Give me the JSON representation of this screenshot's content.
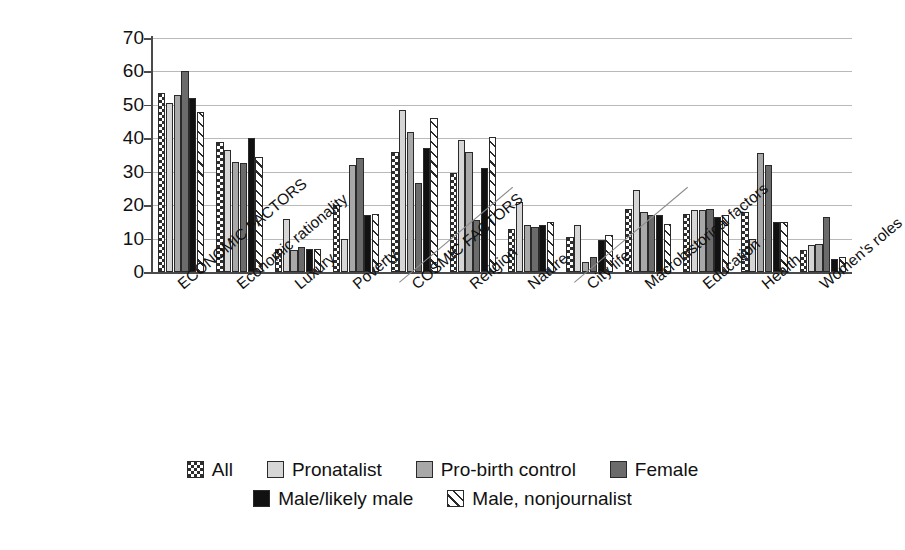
{
  "chart_data": {
    "type": "bar",
    "title": "",
    "xlabel": "",
    "ylabel": "",
    "ylim": [
      0,
      70
    ],
    "yticks": [
      0,
      10,
      20,
      30,
      40,
      50,
      60,
      70
    ],
    "grid": true,
    "legend_position": "bottom",
    "categories": [
      "ECONOMIC FACTORS",
      "Economic rationality",
      "Luxury",
      "Poverty",
      "COSMIC FACTORS",
      "Religion",
      "Nature",
      "City life",
      "Macrohistorical factors",
      "Education",
      "Health",
      "Women's roles"
    ],
    "series": [
      {
        "name": "All",
        "color": "#2e2e2e",
        "pattern": "checkerboard",
        "values": [
          53.5,
          39,
          7,
          20,
          36,
          29.5,
          13,
          10.5,
          19,
          17.5,
          18,
          6.5
        ]
      },
      {
        "name": "Pronatalist",
        "color": "#d6d6d6",
        "pattern": "solid-light",
        "values": [
          50.5,
          36.5,
          16,
          10,
          48.5,
          39.5,
          21,
          14,
          24.5,
          18.5,
          10,
          8
        ]
      },
      {
        "name": "Pro-birth control",
        "color": "#a8a8a8",
        "pattern": "solid-medium",
        "values": [
          53,
          33,
          6.5,
          32,
          42,
          36,
          14,
          3,
          18,
          18.5,
          35.5,
          8.5
        ]
      },
      {
        "name": "Female",
        "color": "#6b6b6b",
        "pattern": "solid-dark",
        "values": [
          60,
          32.5,
          7.5,
          34,
          26.5,
          15.5,
          13.5,
          4.5,
          17,
          19,
          32,
          16.5
        ]
      },
      {
        "name": "Male/likely male",
        "color": "#111111",
        "pattern": "solid-black",
        "values": [
          52,
          40,
          7,
          17,
          37,
          31,
          14,
          9.5,
          17,
          16.5,
          15,
          4
        ]
      },
      {
        "name": "Male, nonjournalist",
        "color": "#ffffff",
        "pattern": "diagonal-hatch",
        "values": [
          48,
          34.5,
          7,
          17.5,
          46,
          40.5,
          15,
          11,
          14.5,
          17,
          15,
          4.5
        ]
      }
    ],
    "group_separators": [
      "COSMIC FACTORS",
      "City life"
    ]
  },
  "legend": {
    "items": [
      {
        "label": "All"
      },
      {
        "label": "Pronatalist"
      },
      {
        "label": "Pro-birth control"
      },
      {
        "label": "Female"
      },
      {
        "label": "Male/likely male"
      },
      {
        "label": "Male, nonjournalist"
      }
    ]
  }
}
